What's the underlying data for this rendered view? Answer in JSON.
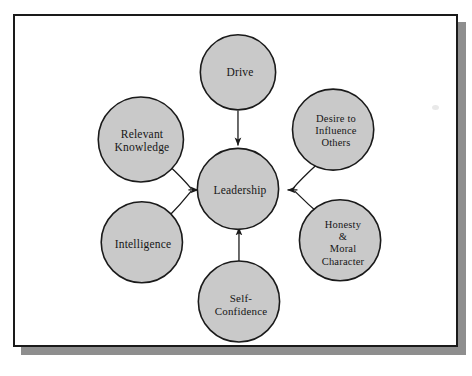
{
  "figure": {
    "kind": "concentric-hub-and-spoke diagram",
    "center": {
      "id": "leadership",
      "label": "Leadership",
      "cx": 238,
      "cy": 189,
      "r": 41,
      "font_size": 11.5
    },
    "satellites": [
      {
        "id": "drive",
        "label": "Drive",
        "cx": 238,
        "cy": 71,
        "r": 38,
        "font_size": 11.5,
        "connector": "straight-down"
      },
      {
        "id": "desire-to-influence-others",
        "label": "Desire to\nInfluence\nOthers",
        "cx": 334,
        "cy": 129,
        "r": 41,
        "font_size": 10.5,
        "connector": "curve-from-upper-right"
      },
      {
        "id": "honesty-moral-character",
        "label": "Honesty\n&\nMoral\nCharacter",
        "cx": 341,
        "cy": 241,
        "r": 41,
        "font_size": 10.5,
        "connector": "curve-from-lower-right"
      },
      {
        "id": "self-confidence",
        "label": "Self-\nConfidence",
        "cx": 239,
        "cy": 303,
        "r": 41,
        "font_size": 11,
        "connector": "straight-up"
      },
      {
        "id": "intelligence",
        "label": "Intelligence",
        "cx": 141,
        "cy": 243,
        "r": 41,
        "font_size": 11.5,
        "connector": "curve-from-lower-left"
      },
      {
        "id": "relevant-knowledge",
        "label": "Relevant\nKnowledge",
        "cx": 140,
        "cy": 139,
        "r": 43,
        "font_size": 11.5,
        "connector": "curve-from-upper-left"
      }
    ],
    "colors": {
      "circle_fill": "#c9c9c9",
      "circle_stroke": "#1a1a1a",
      "text": "#161616",
      "frame_stroke": "#1a1a1a",
      "frame_shadow": "#8e8e8e",
      "page_background": "#ffffff"
    }
  }
}
